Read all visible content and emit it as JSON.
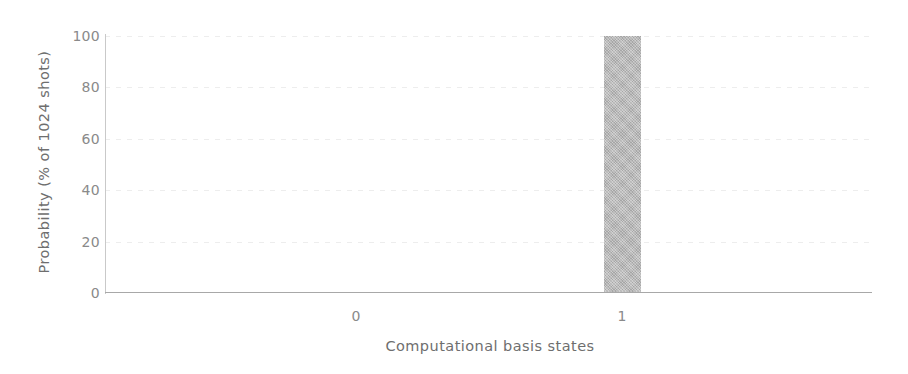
{
  "chart_data": {
    "type": "bar",
    "title": "",
    "subtitle": "",
    "xlabel": "Computational basis states",
    "ylabel": "Probability (% of 1024 shots)",
    "categories": [
      "0",
      "1"
    ],
    "values": [
      0,
      100
    ],
    "series": [
      {
        "name": "Measurement outcome",
        "values": [
          0,
          100
        ]
      }
    ],
    "ylim": [
      0,
      100
    ],
    "yticks": [
      "0",
      "20",
      "40",
      "60",
      "80",
      "100"
    ],
    "ytick_values": [
      0,
      20,
      40,
      60,
      80,
      100
    ],
    "xticks": [
      "0",
      "1"
    ],
    "grid": true,
    "grid_axis": "y",
    "legend": "none",
    "annotations": [],
    "bar_color": "#b6b6b6",
    "axis_color": "#a8a8a8",
    "grid_color": "#f0f0f0",
    "text_color": "#6e6e6e",
    "tick_color": "#8a8a8a",
    "background": "#ffffff"
  },
  "axes": {
    "y_title": "Probability (% of 1024 shots)",
    "x_title": "Computational basis states",
    "y_ticks": [
      {
        "label": "100",
        "value": 100
      },
      {
        "label": "80",
        "value": 80
      },
      {
        "label": "60",
        "value": 60
      },
      {
        "label": "40",
        "value": 40
      },
      {
        "label": "20",
        "value": 20
      },
      {
        "label": "0",
        "value": 0
      }
    ],
    "x_ticks": [
      {
        "label": "0",
        "value": 0
      },
      {
        "label": "1",
        "value": 1
      }
    ]
  }
}
